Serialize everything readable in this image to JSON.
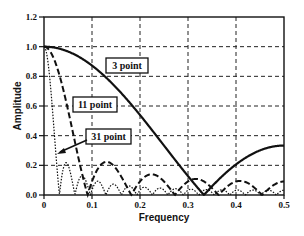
{
  "chart_data": {
    "type": "line",
    "title": "",
    "xlabel": "Frequency",
    "ylabel": "Amplitude",
    "xlim": [
      0,
      0.5
    ],
    "ylim": [
      0,
      1.2
    ],
    "x_ticks": [
      "0",
      "0.1",
      "0.2",
      "0.3",
      "0.4",
      "0.5"
    ],
    "y_ticks": [
      "0.0",
      "0.2",
      "0.4",
      "0.6",
      "0.8",
      "1.0",
      "1.2"
    ],
    "grid": true,
    "legend_position": "inline labels",
    "series": [
      {
        "name": "3 point",
        "points": 3,
        "style": "solid",
        "x": [
          0,
          0.05,
          0.1,
          0.15,
          0.2,
          0.25,
          0.3,
          0.333,
          0.35,
          0.4,
          0.45,
          0.5
        ],
        "values": [
          1.0,
          0.97,
          0.87,
          0.73,
          0.54,
          0.33,
          0.12,
          0.0,
          0.06,
          0.2,
          0.3,
          0.33
        ]
      },
      {
        "name": "11 point",
        "points": 11,
        "style": "dashed",
        "x": [
          0,
          0.02,
          0.04,
          0.06,
          0.091,
          0.13,
          0.182,
          0.22,
          0.273,
          0.31,
          0.364,
          0.4,
          0.455,
          0.5
        ],
        "values": [
          1.0,
          0.93,
          0.74,
          0.47,
          0.0,
          0.22,
          0.0,
          0.13,
          0.0,
          0.1,
          0.0,
          0.09,
          0.0,
          0.09
        ]
      },
      {
        "name": "31 point",
        "points": 31,
        "style": "dotted",
        "x": [
          0,
          0.01,
          0.02,
          0.032,
          0.048,
          0.065,
          0.08,
          0.097,
          0.5
        ],
        "values": [
          1.0,
          0.86,
          0.52,
          0.0,
          0.22,
          0.0,
          0.13,
          0.0,
          0.03
        ]
      }
    ],
    "annotations": [
      {
        "text": "3 point",
        "x": 0.16,
        "y": 0.85
      },
      {
        "text": "11 point",
        "x": 0.095,
        "y": 0.55
      },
      {
        "text": "31 point",
        "x": 0.11,
        "y": 0.4,
        "arrow_to": [
          0.015,
          0.3
        ]
      }
    ]
  }
}
